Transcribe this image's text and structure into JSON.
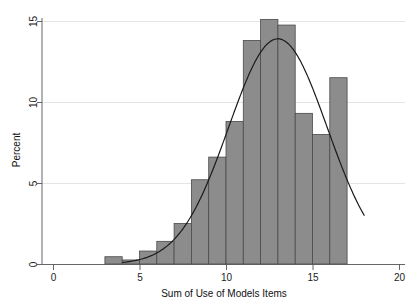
{
  "chart_data": {
    "type": "bar",
    "title": "",
    "subtitle": "",
    "xlabel": "Sum of Use of Models Items",
    "ylabel": "Percent",
    "xlim": [
      -1,
      20.5
    ],
    "ylim": [
      0,
      16.2
    ],
    "grid": true,
    "legend": false,
    "legend_position": "none",
    "x_ticks": [
      0,
      5,
      10,
      15,
      20
    ],
    "x_tick_labels": [
      "0",
      "5",
      "10",
      "15",
      "20"
    ],
    "y_ticks": [
      0,
      5,
      10,
      15
    ],
    "y_tick_labels": [
      "0",
      "5",
      "10",
      "15"
    ],
    "bin_width": 1,
    "bin_starts": [
      3,
      4,
      5,
      6,
      7,
      8,
      9,
      10,
      11,
      12,
      13,
      14,
      15,
      16,
      17
    ],
    "categories": [
      "3-4",
      "4-5",
      "5-6",
      "6-7",
      "7-8",
      "8-9",
      "9-10",
      "10-11",
      "11-12",
      "12-13",
      "13-14",
      "14-15",
      "15-16",
      "16-17",
      "17-18"
    ],
    "values": [
      0.45,
      0.25,
      0.8,
      1.4,
      2.5,
      5.2,
      6.6,
      8.8,
      13.8,
      15.1,
      14.75,
      9.3,
      8.0,
      11.5,
      0
    ],
    "bars": [
      {
        "start": 3,
        "end": 4,
        "value": 0.45
      },
      {
        "start": 4,
        "end": 5,
        "value": 0.25
      },
      {
        "start": 5,
        "end": 6,
        "value": 0.8
      },
      {
        "start": 6,
        "end": 7,
        "value": 1.4
      },
      {
        "start": 7,
        "end": 8,
        "value": 2.5
      },
      {
        "start": 8,
        "end": 9,
        "value": 5.2
      },
      {
        "start": 9,
        "end": 10,
        "value": 6.6
      },
      {
        "start": 10,
        "end": 11,
        "value": 8.8
      },
      {
        "start": 11,
        "end": 12,
        "value": 13.8
      },
      {
        "start": 12,
        "end": 13,
        "value": 15.1
      },
      {
        "start": 13,
        "end": 14,
        "value": 14.75
      },
      {
        "start": 14,
        "end": 15,
        "value": 9.3
      },
      {
        "start": 15,
        "end": 16,
        "value": 8.0
      },
      {
        "start": 16,
        "end": 17,
        "value": 11.5
      }
    ],
    "overlay": {
      "name": "normal-density-curve",
      "type": "line",
      "mean": 13.0,
      "sd": 2.85,
      "peak_value": 13.9,
      "x_start": 4.0,
      "x_end": 18.0
    },
    "colors": {
      "bar_fill": "#8c8c8c",
      "bar_edge": "#4a4a4a",
      "curve": "#1a1a1a",
      "grid": "#d9d9d9",
      "axis": "#555555",
      "text": "#222222",
      "background": "#ffffff"
    }
  }
}
